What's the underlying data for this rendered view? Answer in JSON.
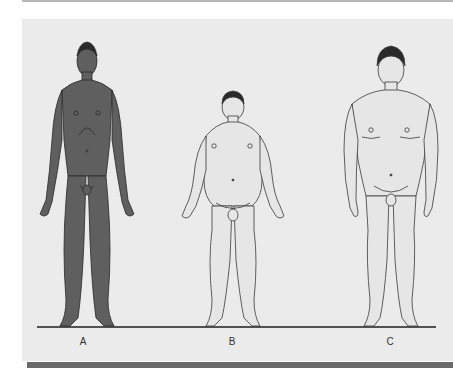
{
  "figure": {
    "figures": [
      {
        "label": "A",
        "build": "slender",
        "fill": "#5f5f5f"
      },
      {
        "label": "B",
        "build": "rounded",
        "fill": "#e6e6e6"
      },
      {
        "label": "C",
        "build": "muscular",
        "fill": "#e6e6e6"
      }
    ],
    "colors": {
      "panel": "#ebebeb",
      "ground_line": "#1e1e1e",
      "outline": "#3a3a3a",
      "bottom_bar": "#6a6a6a"
    }
  }
}
